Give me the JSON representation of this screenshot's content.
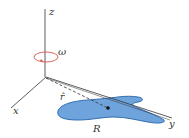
{
  "diagram": {
    "axes": {
      "x_label": "x",
      "y_label": "y",
      "z_label": "z"
    },
    "rotation_label": "ω",
    "vector_label": "r̂",
    "region_label": "R",
    "colors": {
      "axis": "#333333",
      "rotation_arrow": "#d9534f",
      "region_fill": "#6fa3dc",
      "region_stroke": "#2f6db0",
      "point": "#111111"
    }
  }
}
